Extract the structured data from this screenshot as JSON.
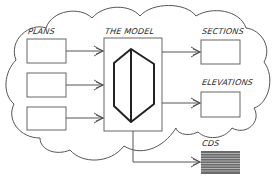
{
  "diagram": {
    "cloud_color": "#555555",
    "line_color": "#555555",
    "model_shape_color": "#222222",
    "nodes": {
      "plans": {
        "label": "PLANS",
        "count": 3
      },
      "model": {
        "label": "THE MODEL"
      },
      "sections": {
        "label": "SECTIONS"
      },
      "elevations": {
        "label": "ELEVATIONS"
      },
      "cds": {
        "label": "CDS"
      }
    },
    "edges": [
      {
        "from": "plans-1",
        "to": "model"
      },
      {
        "from": "plans-2",
        "to": "model"
      },
      {
        "from": "plans-3",
        "to": "model"
      },
      {
        "from": "model",
        "to": "sections"
      },
      {
        "from": "model",
        "to": "elevations"
      },
      {
        "from": "model",
        "to": "cds"
      }
    ]
  }
}
